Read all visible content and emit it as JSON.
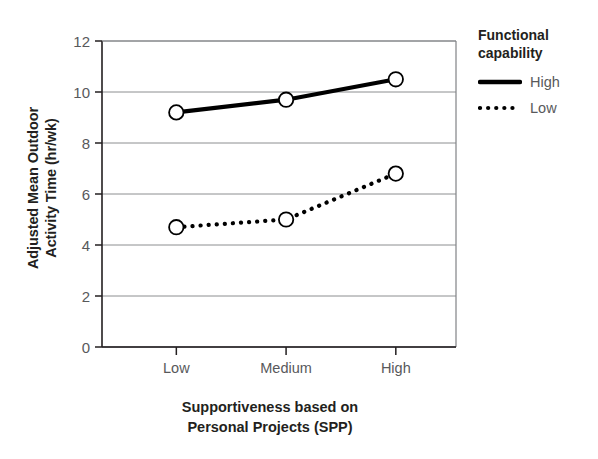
{
  "chart_data": {
    "type": "line",
    "title": "",
    "xlabel": "Supportiveness based on Personal Projects (SPP)",
    "xlabel_lines": [
      "Supportiveness based on",
      "Personal Projects (SPP)"
    ],
    "ylabel": "Adjusted Mean Outdoor Activity Time (hr/wk)",
    "ylabel_lines": [
      "Adjusted Mean Outdoor",
      "Activity Time (hr/wk)"
    ],
    "categories": [
      "Low",
      "Medium",
      "High"
    ],
    "series": [
      {
        "name": "High",
        "values": [
          9.2,
          9.7,
          10.5
        ],
        "style": "solid",
        "color": "#000000",
        "marker": "open-circle"
      },
      {
        "name": "Low",
        "values": [
          4.7,
          5.0,
          6.8
        ],
        "style": "dotted",
        "color": "#000000",
        "marker": "open-circle"
      }
    ],
    "ylim": [
      0,
      12
    ],
    "yticks": [
      0,
      2,
      4,
      6,
      8,
      10,
      12
    ],
    "ytick_labels": [
      "0",
      "2",
      "4",
      "6",
      "8",
      "10",
      "12"
    ],
    "grid": "horizontal",
    "grid_color": "#808285",
    "axis_color": "#231f20",
    "legend_position": "right",
    "legend": {
      "title_lines": [
        "Functional",
        "capability"
      ],
      "title": "Functional capability",
      "entries": [
        {
          "label": "High",
          "style": "solid"
        },
        {
          "label": "Low",
          "style": "dotted"
        }
      ]
    }
  }
}
